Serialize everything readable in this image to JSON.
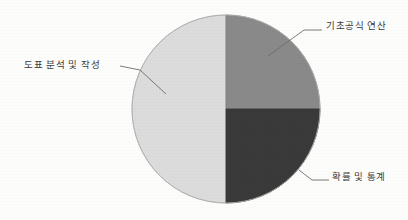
{
  "chart_data": {
    "type": "pie",
    "title": "",
    "subtitle": "",
    "labels": [
      "도표 분석 및 작성",
      "기초공식 연산",
      "확률 및 통계"
    ],
    "values": [
      50,
      25,
      25
    ],
    "slices": [
      {
        "name": "도표 분석 및 작성",
        "value": 50,
        "color": "#dcdcdc",
        "start_angle_deg": 180,
        "end_angle_deg": 360
      },
      {
        "name": "기초공식 연산",
        "value": 25,
        "color": "#8a8a8a",
        "start_angle_deg": 0,
        "end_angle_deg": 90
      },
      {
        "name": "확률 및 통계",
        "value": 25,
        "color": "#3a3a3a",
        "start_angle_deg": 90,
        "end_angle_deg": 180
      }
    ],
    "legend": "none",
    "labels_position": "outside-with-leader-lines",
    "grid": false,
    "background_color": "#fdfdfc",
    "outline_color": "#b0b0b0",
    "leader_line_color": "#6d6d6d",
    "center_x": 226,
    "center_y": 109,
    "radius": 94
  },
  "labels": {
    "basic_formula": "기초공식 연산",
    "chart_analysis": "도표 분석 및 작성",
    "probability_statistics": "확률 및 통계"
  }
}
